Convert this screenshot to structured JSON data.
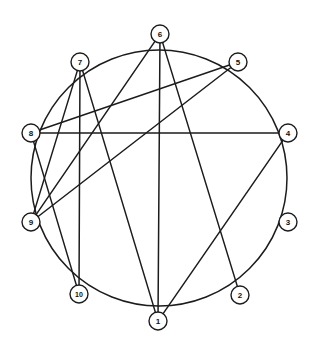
{
  "figure": {
    "type": "circular-graph-diagram",
    "background_color": "#ffffff",
    "stroke_color": "#1c1c1c",
    "node_fill_color": "#ffffff",
    "node_count": 10,
    "edge_count": 11,
    "layout": "nodes evenly spaced on a circle, labels 1-10 counter-clockwise from bottom"
  },
  "chart_data": {
    "type": "graph",
    "title": "",
    "layout": "circular",
    "center": {
      "x": 159,
      "y": 178
    },
    "radius": 128,
    "nodes": [
      {
        "id": "1",
        "label": "1",
        "x": 158,
        "y": 321,
        "angle_deg": 270
      },
      {
        "id": "2",
        "label": "2",
        "x": 240,
        "y": 295,
        "angle_deg": 306
      },
      {
        "id": "3",
        "label": "3",
        "x": 288,
        "y": 222,
        "angle_deg": 342
      },
      {
        "id": "4",
        "label": "4",
        "x": 288,
        "y": 133,
        "angle_deg": 18
      },
      {
        "id": "5",
        "label": "5",
        "x": 238,
        "y": 62,
        "angle_deg": 54
      },
      {
        "id": "6",
        "label": "6",
        "x": 160,
        "y": 34,
        "angle_deg": 90
      },
      {
        "id": "7",
        "label": "7",
        "x": 80,
        "y": 62,
        "angle_deg": 126
      },
      {
        "id": "8",
        "label": "8",
        "x": 31,
        "y": 133,
        "angle_deg": 162
      },
      {
        "id": "9",
        "label": "9",
        "x": 31,
        "y": 222,
        "angle_deg": 198
      },
      {
        "id": "10",
        "label": "10",
        "x": 79,
        "y": 294,
        "angle_deg": 234
      }
    ],
    "node_radius": 9,
    "edges": [
      {
        "source": "1",
        "target": "4"
      },
      {
        "source": "1",
        "target": "6"
      },
      {
        "source": "1",
        "target": "7"
      },
      {
        "source": "2",
        "target": "6"
      },
      {
        "source": "4",
        "target": "8"
      },
      {
        "source": "5",
        "target": "8"
      },
      {
        "source": "5",
        "target": "9"
      },
      {
        "source": "6",
        "target": "9"
      },
      {
        "source": "7",
        "target": "9"
      },
      {
        "source": "7",
        "target": "10"
      },
      {
        "source": "8",
        "target": "10"
      }
    ],
    "ring_arcs": [
      {
        "source": "1",
        "target": "2"
      },
      {
        "source": "2",
        "target": "3"
      },
      {
        "source": "3",
        "target": "4"
      },
      {
        "source": "4",
        "target": "5"
      },
      {
        "source": "5",
        "target": "6"
      },
      {
        "source": "6",
        "target": "7"
      },
      {
        "source": "7",
        "target": "8"
      },
      {
        "source": "8",
        "target": "9"
      },
      {
        "source": "9",
        "target": "10"
      },
      {
        "source": "10",
        "target": "1"
      }
    ],
    "degrees": {
      "1": 5,
      "2": 3,
      "3": 2,
      "4": 4,
      "5": 5,
      "6": 5,
      "7": 5,
      "8": 5,
      "9": 5,
      "10": 5
    }
  }
}
